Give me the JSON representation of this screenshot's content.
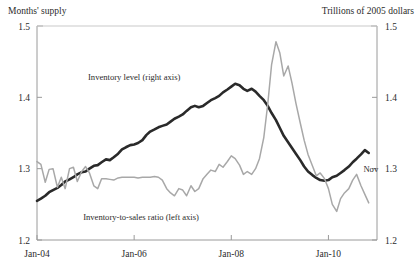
{
  "chart_data": {
    "type": "line",
    "title": "",
    "unit_left": "Months' supply",
    "unit_right": "Trillions of 2005 dollars",
    "xlabel": "",
    "ylabel_left": "Months' supply",
    "ylabel_right": "Trillions of 2005 dollars",
    "grid": false,
    "legend": "inline-annotations",
    "xlim": [
      2004.0,
      2011.0
    ],
    "ylim_left": [
      1.2,
      1.5
    ],
    "ylim_right": [
      1.2,
      1.5
    ],
    "xticks": [
      2004.0,
      2006.0,
      2008.0,
      2010.0
    ],
    "xtick_labels": [
      "Jan-04",
      "Jan-06",
      "Jan-08",
      "Jan-10"
    ],
    "yticks_left": [
      1.2,
      1.3,
      1.4,
      1.5
    ],
    "ytick_labels_left": [
      "1.2",
      "1.3",
      "1.4",
      "1.5"
    ],
    "yticks_right": [
      1.2,
      1.3,
      1.4,
      1.5
    ],
    "ytick_labels_right": [
      "1.2",
      "1.3",
      "1.4",
      "1.5"
    ],
    "annotations": [
      {
        "name": "inventory-level-label",
        "text": "Inventory level (right axis)",
        "x": 2005.05,
        "y": 1.425
      },
      {
        "name": "inventory-to-sales-label",
        "text": "Inventory-to-sales ratio (left axis)",
        "x": 2004.95,
        "y": 1.228
      },
      {
        "name": "last-point-label",
        "text": "Nov",
        "x": 2010.72,
        "y": 1.295
      }
    ],
    "series": [
      {
        "name": "Inventory level (right axis)",
        "axis": "right",
        "color": "#2a2a2a",
        "width": 2.6,
        "x": [
          2004.0,
          2004.08,
          2004.17,
          2004.25,
          2004.33,
          2004.42,
          2004.5,
          2004.58,
          2004.67,
          2004.75,
          2004.83,
          2004.92,
          2005.0,
          2005.08,
          2005.17,
          2005.25,
          2005.33,
          2005.42,
          2005.5,
          2005.58,
          2005.67,
          2005.75,
          2005.83,
          2005.92,
          2006.0,
          2006.08,
          2006.17,
          2006.25,
          2006.33,
          2006.42,
          2006.5,
          2006.58,
          2006.67,
          2006.75,
          2006.83,
          2006.92,
          2007.0,
          2007.08,
          2007.17,
          2007.25,
          2007.33,
          2007.42,
          2007.5,
          2007.58,
          2007.67,
          2007.75,
          2007.83,
          2007.92,
          2008.0,
          2008.08,
          2008.17,
          2008.25,
          2008.33,
          2008.42,
          2008.5,
          2008.58,
          2008.67,
          2008.75,
          2008.83,
          2008.92,
          2009.0,
          2009.08,
          2009.17,
          2009.25,
          2009.33,
          2009.42,
          2009.5,
          2009.58,
          2009.67,
          2009.75,
          2009.83,
          2009.92,
          2010.0,
          2010.08,
          2010.17,
          2010.25,
          2010.33,
          2010.42,
          2010.5,
          2010.58,
          2010.67,
          2010.75,
          2010.83
        ],
        "y": [
          1.255,
          1.258,
          1.262,
          1.267,
          1.27,
          1.273,
          1.277,
          1.282,
          1.285,
          1.288,
          1.292,
          1.295,
          1.296,
          1.3,
          1.304,
          1.305,
          1.309,
          1.313,
          1.312,
          1.316,
          1.321,
          1.327,
          1.33,
          1.333,
          1.334,
          1.336,
          1.34,
          1.347,
          1.352,
          1.355,
          1.358,
          1.36,
          1.362,
          1.366,
          1.37,
          1.373,
          1.376,
          1.381,
          1.386,
          1.388,
          1.386,
          1.388,
          1.392,
          1.396,
          1.399,
          1.402,
          1.407,
          1.411,
          1.415,
          1.419,
          1.417,
          1.412,
          1.409,
          1.412,
          1.408,
          1.402,
          1.396,
          1.388,
          1.378,
          1.368,
          1.357,
          1.346,
          1.337,
          1.329,
          1.321,
          1.312,
          1.303,
          1.296,
          1.291,
          1.287,
          1.284,
          1.283,
          1.284,
          1.288,
          1.29,
          1.294,
          1.298,
          1.303,
          1.309,
          1.314,
          1.32,
          1.326,
          1.322
        ]
      },
      {
        "name": "Inventory-to-sales ratio (left axis)",
        "axis": "left",
        "color": "#a8a8a8",
        "width": 1.5,
        "x": [
          2004.0,
          2004.08,
          2004.17,
          2004.25,
          2004.33,
          2004.42,
          2004.5,
          2004.58,
          2004.67,
          2004.75,
          2004.83,
          2004.92,
          2005.0,
          2005.08,
          2005.17,
          2005.25,
          2005.33,
          2005.42,
          2005.5,
          2005.58,
          2005.67,
          2005.75,
          2005.83,
          2005.92,
          2006.0,
          2006.08,
          2006.17,
          2006.25,
          2006.33,
          2006.42,
          2006.5,
          2006.58,
          2006.67,
          2006.75,
          2006.83,
          2006.92,
          2007.0,
          2007.08,
          2007.17,
          2007.25,
          2007.33,
          2007.42,
          2007.5,
          2007.58,
          2007.67,
          2007.75,
          2007.83,
          2007.92,
          2008.0,
          2008.08,
          2008.17,
          2008.25,
          2008.33,
          2008.42,
          2008.5,
          2008.58,
          2008.67,
          2008.75,
          2008.83,
          2008.92,
          2009.0,
          2009.08,
          2009.17,
          2009.25,
          2009.33,
          2009.42,
          2009.5,
          2009.58,
          2009.67,
          2009.75,
          2009.83,
          2009.92,
          2010.0,
          2010.08,
          2010.17,
          2010.25,
          2010.33,
          2010.42,
          2010.5,
          2010.58,
          2010.67,
          2010.75,
          2010.83
        ],
        "y": [
          1.31,
          1.306,
          1.281,
          1.299,
          1.3,
          1.274,
          1.288,
          1.272,
          1.3,
          1.302,
          1.282,
          1.296,
          1.303,
          1.294,
          1.276,
          1.272,
          1.286,
          1.286,
          1.285,
          1.284,
          1.287,
          1.288,
          1.288,
          1.288,
          1.288,
          1.287,
          1.288,
          1.288,
          1.288,
          1.289,
          1.288,
          1.284,
          1.272,
          1.266,
          1.262,
          1.272,
          1.27,
          1.262,
          1.276,
          1.268,
          1.272,
          1.286,
          1.292,
          1.298,
          1.296,
          1.306,
          1.302,
          1.31,
          1.318,
          1.314,
          1.305,
          1.292,
          1.296,
          1.292,
          1.3,
          1.314,
          1.344,
          1.39,
          1.446,
          1.478,
          1.462,
          1.43,
          1.444,
          1.42,
          1.392,
          1.364,
          1.34,
          1.32,
          1.304,
          1.29,
          1.294,
          1.286,
          1.272,
          1.25,
          1.24,
          1.258,
          1.266,
          1.272,
          1.284,
          1.292,
          1.276,
          1.264,
          1.252
        ]
      }
    ]
  }
}
